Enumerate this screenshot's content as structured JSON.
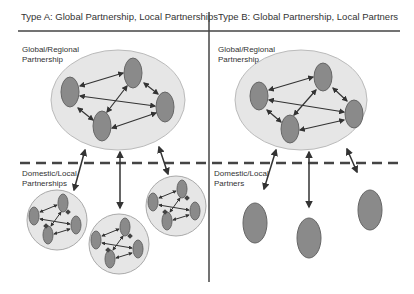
{
  "panels": [
    {
      "title": "Type A: Global Partnership, Local Partnerships",
      "global_label_1": "Global/Regional",
      "global_label_2": "Partnership",
      "local_label_1": "Domestic/Local",
      "local_label_2": "Partnerships"
    },
    {
      "title": "Type B: Global Partnership, Local Partners",
      "global_label_1": "Global/Regional",
      "global_label_2": "Partnership",
      "local_label_1": "Domestic/Local",
      "local_label_2": "Partners"
    }
  ],
  "colors": {
    "node": "#8a8a8a",
    "node_stroke": "#666666",
    "cloud": "#e6e6e6",
    "line": "#333333"
  }
}
